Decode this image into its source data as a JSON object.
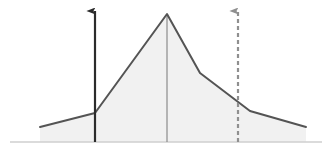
{
  "figure": {
    "title": "",
    "width": 330,
    "height": 153,
    "background_color": "#ffffff"
  },
  "chart_data": {
    "type": "area",
    "title": "",
    "subtitle": "",
    "xlabel": "",
    "ylabel": "",
    "grid": false,
    "legend": null,
    "axis_line": {
      "name": "baseline-axis",
      "y": 142,
      "x_start": 10,
      "x_end": 322,
      "color": "#cfcfcf",
      "width": 1.6
    },
    "series": [
      {
        "name": "distribution-curve",
        "type": "line",
        "stroke_color": "#545454",
        "stroke_width": 2.0,
        "fill_color": "#f1f1f1",
        "fill_to_baseline": true,
        "points": [
          {
            "x": 40,
            "y": 127
          },
          {
            "x": 95,
            "y": 113
          },
          {
            "x": 167,
            "y": 14
          },
          {
            "x": 200,
            "y": 73
          },
          {
            "x": 250,
            "y": 111
          },
          {
            "x": 306,
            "y": 127
          }
        ]
      }
    ],
    "reference_lines": [
      {
        "name": "peak-vertical-line",
        "orientation": "vertical",
        "x": 167,
        "y_top": 14,
        "y_bottom": 142,
        "color": "#8c8c8c",
        "width": 1.2,
        "dashed": false,
        "arrow": false
      }
    ],
    "annotations": [
      {
        "name": "solid-upward-arrow",
        "type": "arrow",
        "orientation": "vertical",
        "direction": "up",
        "x": 95,
        "y_base": 142,
        "y_tip": 11,
        "color": "#2b2b2b",
        "width": 2.2,
        "dashed": false,
        "label": ""
      },
      {
        "name": "dashed-upward-arrow",
        "type": "arrow",
        "orientation": "vertical",
        "direction": "up",
        "x": 238,
        "y_base": 142,
        "y_tip": 11,
        "color": "#8f8f8f",
        "width": 2.2,
        "dashed": true,
        "dash_pattern": "4 3",
        "label": ""
      }
    ],
    "xlim": [
      0,
      330
    ],
    "ylim": [
      153,
      0
    ],
    "x_ticks": [],
    "y_ticks": [],
    "x_tick_labels": [],
    "y_tick_labels": []
  },
  "colors": {
    "curve_stroke": "#545454",
    "curve_fill": "#f1f1f1",
    "solid_arrow": "#2b2b2b",
    "dashed_arrow": "#8f8f8f",
    "peak_line": "#8c8c8c",
    "axis": "#cfcfcf",
    "background": "#ffffff"
  }
}
